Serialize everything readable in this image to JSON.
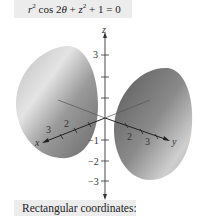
{
  "equation": {
    "text": "r² cos 2θ + z² + 1 = 0",
    "r": "r",
    "sup1": "2",
    "cos": " cos 2",
    "theta": "θ",
    "plus1": " + ",
    "z": "z",
    "sup2": "2",
    "rest": " + 1 = 0"
  },
  "caption": "Rectangular coordinates:",
  "axes": {
    "z_label": "z",
    "x_label": "x",
    "y_label": "y",
    "z_ticks": [
      "3",
      "−1",
      "−2",
      "−3"
    ],
    "x_ticks": [
      "2",
      "3"
    ],
    "y_ticks": [
      "2",
      "3"
    ]
  },
  "colors": {
    "surface_light": "#d8d8d8",
    "surface_dark": "#6a6a6a",
    "box_bg": "#ececec",
    "axis": "#333333"
  }
}
